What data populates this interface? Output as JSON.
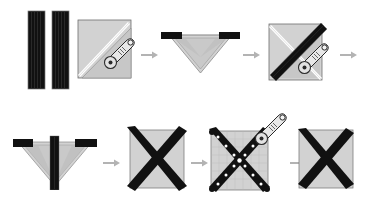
{
  "diagram": {
    "title": "Quilt block assembly steps",
    "background_color": "#ffffff",
    "colors": {
      "fabric_dark": "#111111",
      "fabric_light": "#d2d2d2",
      "fabric_light_shade": "#c4c4c4",
      "fold_line": "#ffffff",
      "outline": "#6e6e6e",
      "arrow": "#b3b3b3",
      "tool_body": "#e8e8e8",
      "tool_outline": "#2a2a2a",
      "mat_grid": "#b8b8b8",
      "pin_dot": "#ffffff"
    },
    "rows": [
      {
        "name": "row-1",
        "steps": [
          {
            "id": "step-1",
            "label": "two dark fabric strips",
            "icon": "two-strips"
          },
          {
            "id": "step-2",
            "label": "light square folded on the diagonal, cut with rotary cutter",
            "icon": "square-diagonal-cutter"
          },
          {
            "id": "step-3",
            "label": "folded triangle with dark strips at the top corners",
            "icon": "triangle-strips"
          },
          {
            "id": "step-4",
            "label": "square with dark diagonal strip, trimmed with rotary cutter",
            "icon": "square-diagonal-strip-cutter"
          }
        ],
        "arrows": 3
      },
      {
        "name": "row-2",
        "steps": [
          {
            "id": "step-5",
            "label": "triangle with centre strip and corner strips",
            "icon": "triangle-center-strip"
          },
          {
            "id": "step-6",
            "label": "finished square with dark X",
            "icon": "square-x"
          },
          {
            "id": "step-7",
            "label": "block pinned on gridded cutting mat, trimmed with rotary cutter",
            "icon": "square-x-mat-cutter"
          },
          {
            "id": "step-8",
            "label": "completed trimmed X block",
            "icon": "square-x-final"
          }
        ],
        "arrows": 3
      }
    ],
    "tools": [
      {
        "name": "rotary-cutter",
        "count": 3
      }
    ]
  }
}
